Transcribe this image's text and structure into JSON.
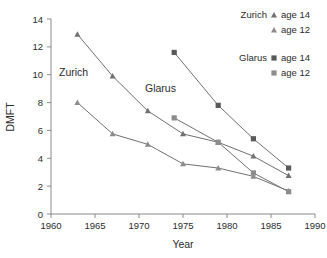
{
  "chart_data": {
    "type": "line",
    "title": "",
    "xlabel": "Year",
    "ylabel": "DMFT",
    "xlim": [
      1960,
      1990
    ],
    "ylim": [
      0,
      14
    ],
    "xticks": [
      1960,
      1965,
      1970,
      1975,
      1980,
      1985,
      1990
    ],
    "yticks": [
      0,
      2,
      4,
      6,
      8,
      10,
      12,
      14
    ],
    "grid": false,
    "legend_position": "top-right",
    "series": [
      {
        "name": "Zurich age 14",
        "region": "Zurich",
        "age": "age 14",
        "marker": "triangle",
        "color": "#707070",
        "x": [
          1963,
          1967,
          1971,
          1975,
          1979,
          1983,
          1987
        ],
        "values": [
          12.9,
          9.9,
          7.4,
          5.75,
          5.15,
          4.15,
          2.75
        ]
      },
      {
        "name": "Zurich age 12",
        "region": "Zurich",
        "age": "age 12",
        "marker": "triangle",
        "color": "#8c8c8c",
        "x": [
          1963,
          1967,
          1971,
          1975,
          1979,
          1983,
          1987
        ],
        "values": [
          8.0,
          5.75,
          5.0,
          3.6,
          3.3,
          2.7,
          1.65
        ]
      },
      {
        "name": "Glarus age 14",
        "region": "Glarus",
        "age": "age 14",
        "marker": "square",
        "color": "#595959",
        "x": [
          1974,
          1979,
          1983,
          1987
        ],
        "values": [
          11.6,
          7.8,
          5.4,
          3.3
        ]
      },
      {
        "name": "Glarus age 12",
        "region": "Glarus",
        "age": "age 12",
        "marker": "square",
        "color": "#8c8c8c",
        "x": [
          1974,
          1979,
          1983,
          1987
        ],
        "values": [
          6.9,
          5.15,
          2.95,
          1.6
        ]
      }
    ],
    "annotations": [
      {
        "text": "Zurich",
        "x": 1963.5,
        "y": 10.0
      },
      {
        "text": "Glarus",
        "x": 1973.0,
        "y": 8.9
      }
    ]
  },
  "axes": {
    "y_title": "DMFT",
    "x_title": "Year",
    "y_tick_labels": [
      "0",
      "2",
      "4",
      "6",
      "8",
      "10",
      "12",
      "14"
    ],
    "x_tick_labels": [
      "1960",
      "1965",
      "1970",
      "1975",
      "1980",
      "1985",
      "1990"
    ]
  },
  "annotations": {
    "zurich": "Zurich",
    "glarus": "Glarus"
  },
  "legend": {
    "groups": [
      {
        "region": "Zurich",
        "entries": [
          {
            "label": "age 14",
            "marker": "triangle"
          },
          {
            "label": "age 12",
            "marker": "triangle"
          }
        ]
      },
      {
        "region": "Glarus",
        "entries": [
          {
            "label": "age 14",
            "marker": "square"
          },
          {
            "label": "age 12",
            "marker": "square"
          }
        ]
      }
    ]
  }
}
